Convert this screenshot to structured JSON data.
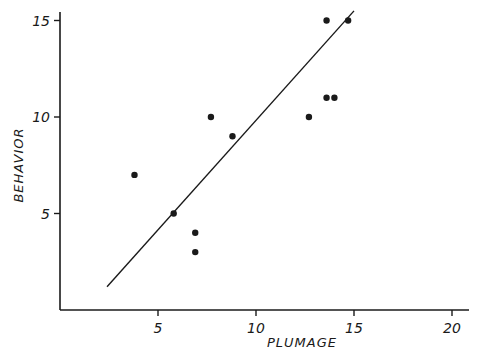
{
  "chart_data": {
    "type": "scatter",
    "title": "",
    "xlabel": "PLUMAGE",
    "ylabel": "BEHAVIOR",
    "xlim": [
      0,
      21
    ],
    "ylim": [
      0,
      15.5
    ],
    "grid": false,
    "legend": null,
    "xticks": [
      5,
      10,
      15,
      20
    ],
    "yticks": [
      5,
      10,
      15
    ],
    "xtick_labels": [
      "5",
      "10",
      "15",
      "20"
    ],
    "ytick_labels": [
      "5",
      "10",
      "15"
    ],
    "series": [
      {
        "name": "observations",
        "points": [
          {
            "x": 3.8,
            "y": 7
          },
          {
            "x": 5.8,
            "y": 5
          },
          {
            "x": 6.9,
            "y": 4
          },
          {
            "x": 6.9,
            "y": 3
          },
          {
            "x": 7.7,
            "y": 10
          },
          {
            "x": 8.8,
            "y": 9
          },
          {
            "x": 12.7,
            "y": 10
          },
          {
            "x": 13.6,
            "y": 11
          },
          {
            "x": 14.0,
            "y": 11
          },
          {
            "x": 13.6,
            "y": 15
          },
          {
            "x": 14.7,
            "y": 15
          }
        ]
      }
    ],
    "annotations": [
      {
        "type": "regression-line",
        "from": {
          "x": 2.4,
          "y": 1.2
        },
        "to": {
          "x": 15.0,
          "y": 15.5
        }
      }
    ]
  }
}
